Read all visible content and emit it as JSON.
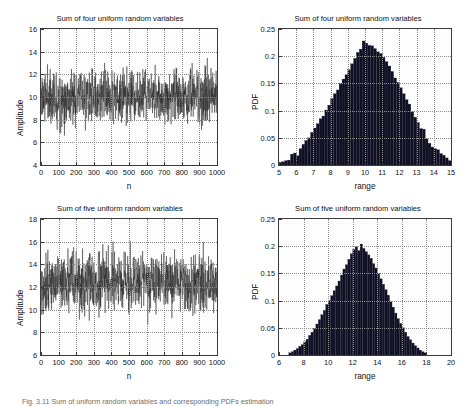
{
  "figure": {
    "background": "#ffffff",
    "caption": "Fig. 3.11 Sum of uniform random variables and corresponding PDFs estimation"
  },
  "chart_data": [
    {
      "id": "top-left",
      "type": "line",
      "title": "Sum of four uniform random variables",
      "xlabel": "n",
      "ylabel": "Amplitude",
      "xlim": [
        0,
        1000
      ],
      "ylim": [
        4,
        16
      ],
      "xticks": [
        0,
        100,
        200,
        300,
        400,
        500,
        600,
        700,
        800,
        900,
        1000
      ],
      "yticks": [
        4,
        6,
        8,
        10,
        12,
        14,
        16
      ],
      "grid": true,
      "series": [
        {
          "name": "sum of four uniform RVs",
          "color": "#262626",
          "n_points": 1000,
          "mean": 10.0,
          "std": 1.155,
          "min_observed": 4.7,
          "max_observed": 15.3,
          "description": "White noise-like trace of the sum of four i.i.d. uniform(0,5) random variables, oscillating about 10 with most excursions inside 8-12."
        }
      ]
    },
    {
      "id": "top-right",
      "type": "bar",
      "title": "Sum of four uniform random variables",
      "xlabel": "range",
      "ylabel": "PDF",
      "xlim": [
        5,
        15
      ],
      "ylim": [
        0,
        0.25
      ],
      "xticks": [
        5,
        6,
        7,
        8,
        9,
        10,
        11,
        12,
        13,
        14,
        15
      ],
      "yticks": [
        0,
        0.05,
        0.1,
        0.15,
        0.2,
        0.25
      ],
      "grid": true,
      "bar_color": "#101024",
      "bin_width": 0.1667,
      "bin_centers": [
        5.08,
        5.25,
        5.42,
        5.58,
        5.75,
        5.92,
        6.08,
        6.25,
        6.42,
        6.58,
        6.75,
        6.92,
        7.08,
        7.25,
        7.42,
        7.58,
        7.75,
        7.92,
        8.08,
        8.25,
        8.42,
        8.58,
        8.75,
        8.92,
        9.08,
        9.25,
        9.42,
        9.58,
        9.75,
        9.92,
        10.08,
        10.25,
        10.42,
        10.58,
        10.75,
        10.92,
        11.08,
        11.25,
        11.42,
        11.58,
        11.75,
        11.92,
        12.08,
        12.25,
        12.42,
        12.58,
        12.75,
        12.92,
        13.08,
        13.25,
        13.42,
        13.58,
        13.75,
        13.92,
        14.08,
        14.25,
        14.42,
        14.58,
        14.75,
        14.92
      ],
      "values": [
        0.005,
        0.006,
        0.008,
        0.009,
        0.02,
        0.022,
        0.017,
        0.03,
        0.038,
        0.045,
        0.05,
        0.06,
        0.068,
        0.076,
        0.085,
        0.09,
        0.101,
        0.11,
        0.122,
        0.131,
        0.138,
        0.15,
        0.158,
        0.166,
        0.175,
        0.186,
        0.196,
        0.207,
        0.213,
        0.228,
        0.224,
        0.22,
        0.219,
        0.214,
        0.208,
        0.205,
        0.198,
        0.19,
        0.182,
        0.172,
        0.16,
        0.152,
        0.142,
        0.131,
        0.12,
        0.112,
        0.098,
        0.088,
        0.078,
        0.067,
        0.066,
        0.048,
        0.04,
        0.033,
        0.03,
        0.028,
        0.021,
        0.018,
        0.013,
        0.008
      ],
      "peak_value": 0.228,
      "peak_location": 9.92
    },
    {
      "id": "bottom-left",
      "type": "line",
      "title": "Sum of five uniform random variables",
      "xlabel": "n",
      "ylabel": "Amplitude",
      "xlim": [
        0,
        1000
      ],
      "ylim": [
        6,
        18
      ],
      "xticks": [
        0,
        100,
        200,
        300,
        400,
        500,
        600,
        700,
        800,
        900,
        1000
      ],
      "yticks": [
        6,
        8,
        10,
        12,
        14,
        16,
        18
      ],
      "grid": true,
      "series": [
        {
          "name": "sum of five uniform RVs",
          "color": "#262626",
          "n_points": 1000,
          "mean": 12.5,
          "std": 1.29,
          "min_observed": 7.2,
          "max_observed": 17.8,
          "description": "White noise-like trace of the sum of five i.i.d. uniform random variables, oscillating about 12.5 with most excursions inside 10-15."
        }
      ]
    },
    {
      "id": "bottom-right",
      "type": "bar",
      "title": "Sum of five uniform random variables",
      "xlabel": "range",
      "ylabel": "PDF",
      "xlim": [
        6,
        20
      ],
      "ylim": [
        0,
        0.25
      ],
      "xticks": [
        6,
        8,
        10,
        12,
        14,
        16,
        18,
        20
      ],
      "yticks": [
        0,
        0.05,
        0.1,
        0.15,
        0.2,
        0.25
      ],
      "grid": true,
      "bar_color": "#101024",
      "bin_width": 0.2,
      "bin_centers": [
        6.9,
        7.1,
        7.3,
        7.5,
        7.7,
        7.9,
        8.1,
        8.3,
        8.5,
        8.7,
        8.9,
        9.1,
        9.3,
        9.5,
        9.7,
        9.9,
        10.1,
        10.3,
        10.5,
        10.7,
        10.9,
        11.1,
        11.3,
        11.5,
        11.7,
        11.9,
        12.1,
        12.3,
        12.5,
        12.7,
        12.9,
        13.1,
        13.3,
        13.5,
        13.7,
        13.9,
        14.1,
        14.3,
        14.5,
        14.7,
        14.9,
        15.1,
        15.3,
        15.5,
        15.7,
        15.9,
        16.1,
        16.3,
        16.5,
        16.7,
        16.9,
        17.1,
        17.3,
        17.5,
        17.7,
        17.9
      ],
      "values": [
        0.004,
        0.006,
        0.009,
        0.012,
        0.016,
        0.019,
        0.024,
        0.029,
        0.036,
        0.042,
        0.049,
        0.057,
        0.065,
        0.074,
        0.082,
        0.093,
        0.1,
        0.109,
        0.118,
        0.127,
        0.136,
        0.147,
        0.158,
        0.166,
        0.176,
        0.186,
        0.194,
        0.199,
        0.192,
        0.204,
        0.196,
        0.19,
        0.184,
        0.178,
        0.168,
        0.16,
        0.15,
        0.14,
        0.13,
        0.12,
        0.11,
        0.098,
        0.088,
        0.077,
        0.067,
        0.058,
        0.05,
        0.042,
        0.034,
        0.028,
        0.022,
        0.017,
        0.013,
        0.009,
        0.006,
        0.004
      ],
      "peak_value": 0.204,
      "peak_location": 12.7
    }
  ]
}
